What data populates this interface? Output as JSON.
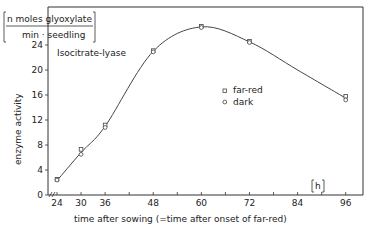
{
  "chart_data": {
    "type": "line",
    "title": "Isocitrate-lyase",
    "xlabel": "time after sowing (=time after onset of far-red)",
    "x_unit": "[h]",
    "ylabel": "enzyme activity",
    "y_unit_numerator": "n moles glyoxylate",
    "y_unit_denominator": "min · seedling",
    "x_ticks": [
      24,
      30,
      36,
      48,
      60,
      72,
      84,
      96
    ],
    "y_ticks": [
      0,
      4,
      8,
      12,
      16,
      20,
      24
    ],
    "xlim": [
      24,
      96
    ],
    "ylim": [
      0,
      24
    ],
    "grid": false,
    "legend_position": "right-center",
    "series": [
      {
        "name": "far-red",
        "marker": "square",
        "x": [
          24,
          30,
          36,
          48,
          60,
          72,
          96
        ],
        "values": [
          2.5,
          7.3,
          11.2,
          23.1,
          27.0,
          24.6,
          15.8
        ]
      },
      {
        "name": "dark",
        "marker": "circle",
        "x": [
          24,
          30,
          36,
          48,
          60,
          72,
          96
        ],
        "values": [
          2.4,
          6.5,
          10.8,
          22.9,
          26.8,
          24.4,
          15.2
        ]
      }
    ],
    "fit_curve": {
      "x": [
        24,
        30,
        36,
        48,
        60,
        72,
        84,
        96
      ],
      "values": [
        2.3,
        6.8,
        11.0,
        23.0,
        26.9,
        24.5,
        20.0,
        15.5
      ]
    }
  },
  "labels": {
    "title": "Isocitrate-lyase",
    "ylabel": "enzyme activity",
    "unit_num": "n moles glyoxylate",
    "unit_den": "min · seedling",
    "xlabel": "time  after  sowing  (=time  after  onset  of  far-red)",
    "x_unit": "h",
    "legend_farred": "far-red",
    "legend_dark": "dark"
  }
}
